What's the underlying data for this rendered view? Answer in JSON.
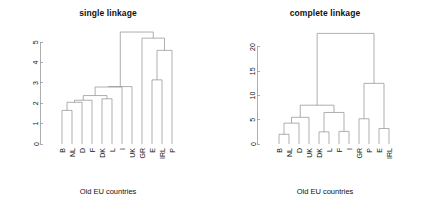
{
  "figure": {
    "width": 433,
    "height": 204,
    "background": "#ffffff",
    "line_color": "#8c8c8c",
    "text_color": "#111111"
  },
  "panels": [
    {
      "key": "single",
      "title": "single linkage",
      "xlabel": "Old EU countries"
    },
    {
      "key": "complete",
      "title": "complete linkage",
      "xlabel": "Old EU countries"
    }
  ],
  "chart_data": [
    {
      "type": "dendrogram",
      "title": "single linkage",
      "xlabel": "Old EU countries",
      "ylabel": "",
      "ylim": [
        0,
        5.6
      ],
      "yticks": [
        0,
        1,
        2,
        3,
        4,
        5
      ],
      "ytick_labels": [
        "0",
        "1",
        "2",
        "3",
        "4",
        "5"
      ],
      "grid": false,
      "leaf_order": [
        "B",
        "NL",
        "D",
        "F",
        "DK",
        "L",
        "I",
        "UK",
        "GR",
        "E",
        "IRL",
        "P"
      ],
      "merges": [
        {
          "id": "m1",
          "left": "B",
          "right": "NL",
          "height": 1.65
        },
        {
          "id": "m2",
          "left": "m1",
          "right": "D",
          "height": 2.05
        },
        {
          "id": "m3",
          "left": "DK",
          "right": "L",
          "height": 2.22
        },
        {
          "id": "m4",
          "left": "m2",
          "right": "F",
          "height": 2.15
        },
        {
          "id": "m5",
          "left": "m4",
          "right": "m3",
          "height": 2.38
        },
        {
          "id": "m6",
          "left": "m5",
          "right": "I",
          "height": 2.8
        },
        {
          "id": "m7",
          "left": "m6",
          "right": "UK",
          "height": 2.82
        },
        {
          "id": "m8",
          "left": "E",
          "right": "IRL",
          "height": 3.15
        },
        {
          "id": "m9",
          "left": "m8",
          "right": "P",
          "height": 4.6
        },
        {
          "id": "m10",
          "left": "GR",
          "right": "m9",
          "height": 5.2
        },
        {
          "id": "m11",
          "left": "m7",
          "right": "m10",
          "height": 5.5
        }
      ]
    },
    {
      "type": "dendrogram",
      "title": "complete linkage",
      "xlabel": "Old EU countries",
      "ylabel": "",
      "ylim": [
        0,
        23.5
      ],
      "yticks": [
        0,
        5,
        10,
        15,
        20
      ],
      "ytick_labels": [
        "0",
        "5",
        "10",
        "15",
        "20"
      ],
      "grid": false,
      "leaf_order": [
        "B",
        "NL",
        "D",
        "UK",
        "DK",
        "L",
        "F",
        "I",
        "GR",
        "P",
        "E",
        "IRL"
      ],
      "merges": [
        {
          "id": "c1",
          "left": "B",
          "right": "NL",
          "height": 2.0
        },
        {
          "id": "c2",
          "left": "c1",
          "right": "D",
          "height": 4.3
        },
        {
          "id": "c3",
          "left": "c2",
          "right": "UK",
          "height": 5.5
        },
        {
          "id": "c4",
          "left": "DK",
          "right": "L",
          "height": 2.5
        },
        {
          "id": "c5",
          "left": "F",
          "right": "I",
          "height": 2.6
        },
        {
          "id": "c6",
          "left": "c4",
          "right": "c5",
          "height": 6.5
        },
        {
          "id": "c7",
          "left": "c3",
          "right": "c6",
          "height": 8.0
        },
        {
          "id": "c8",
          "left": "GR",
          "right": "P",
          "height": 5.2
        },
        {
          "id": "c9",
          "left": "E",
          "right": "IRL",
          "height": 3.2
        },
        {
          "id": "c10",
          "left": "c8",
          "right": "c9",
          "height": 12.5
        },
        {
          "id": "c11",
          "left": "c7",
          "right": "c10",
          "height": 22.8
        }
      ]
    }
  ]
}
